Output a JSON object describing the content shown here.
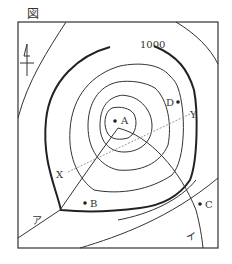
{
  "figure": {
    "caption": "図"
  },
  "map": {
    "contour_label": "1000",
    "points": [
      {
        "id": "A",
        "label": "A"
      },
      {
        "id": "B",
        "label": "B"
      },
      {
        "id": "C",
        "label": "C"
      },
      {
        "id": "D",
        "label": "D"
      }
    ],
    "section_line": {
      "start_label": "X",
      "end_label": "Y"
    },
    "lines": [
      {
        "id": "a",
        "label": "ア"
      },
      {
        "id": "i",
        "label": "イ"
      }
    ],
    "north_arrow": "north-arrow",
    "colors": {
      "line": "#333333",
      "section_line": "#999999",
      "background": "#ffffff"
    }
  }
}
